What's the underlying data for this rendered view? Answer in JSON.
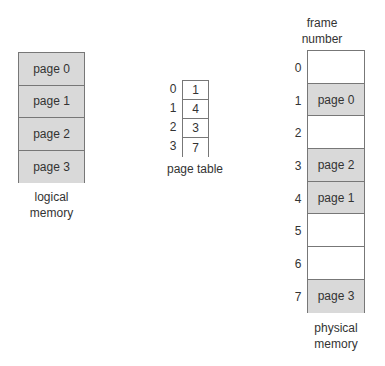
{
  "logical_memory": {
    "label_line1": "logical",
    "label_line2": "memory",
    "pages": [
      "page 0",
      "page 1",
      "page 2",
      "page 3"
    ]
  },
  "page_table": {
    "label": "page table",
    "indices": [
      "0",
      "1",
      "2",
      "3"
    ],
    "frames": [
      "1",
      "4",
      "3",
      "7"
    ]
  },
  "physical_memory": {
    "header_line1": "frame",
    "header_line2": "number",
    "label_line1": "physical",
    "label_line2": "memory",
    "frame_numbers": [
      "0",
      "1",
      "2",
      "3",
      "4",
      "5",
      "6",
      "7"
    ],
    "frames": [
      "",
      "page 0",
      "",
      "page 2",
      "page 1",
      "",
      "",
      "page 3"
    ]
  },
  "colors": {
    "filled": "#d9d9d9",
    "empty": "#ffffff",
    "border": "#777777"
  }
}
